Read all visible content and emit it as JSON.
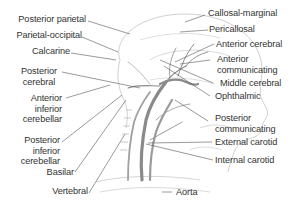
{
  "diagram": {
    "colors": {
      "background": "#ffffff",
      "label_text": "#333333",
      "leader_line": "#555555",
      "outline": "#bdbdbd",
      "artery_fill": "#8a8a8a"
    },
    "labels_left": [
      {
        "id": "posterior-parietal",
        "text": "Posterior parietal"
      },
      {
        "id": "parietal-occipital",
        "text": "Parietal-occipital"
      },
      {
        "id": "calcarine",
        "text": "Calcarine"
      },
      {
        "id": "posterior-cerebral",
        "line1": "Posterior",
        "line2": "cerebral"
      },
      {
        "id": "anterior-inferior-cerebellar",
        "line1": "Anterior",
        "line2": "inferior",
        "line3": "cerebellar"
      },
      {
        "id": "posterior-inferior-cerebellar",
        "line1": "Posterior",
        "line2": "inferior",
        "line3": "cerebellar"
      },
      {
        "id": "basilar",
        "text": "Basilar"
      },
      {
        "id": "vertebral",
        "text": "Vertebral"
      }
    ],
    "labels_right": [
      {
        "id": "callosal-marginal",
        "text": "Callosal-marginal"
      },
      {
        "id": "pericallosal",
        "text": "Pericallosal"
      },
      {
        "id": "anterior-cerebral",
        "text": "Anterior cerebral"
      },
      {
        "id": "anterior-communicating",
        "line1": "Anterior",
        "line2": "communicating"
      },
      {
        "id": "middle-cerebral",
        "text": "Middle cerebral"
      },
      {
        "id": "ophthalmic",
        "text": "Ophthalmic"
      },
      {
        "id": "posterior-communicating",
        "line1": "Posterior",
        "line2": "communicating"
      },
      {
        "id": "external-carotid",
        "text": "External carotid"
      },
      {
        "id": "internal-carotid",
        "text": "Internal carotid"
      },
      {
        "id": "aorta",
        "text": "Aorta"
      }
    ]
  }
}
